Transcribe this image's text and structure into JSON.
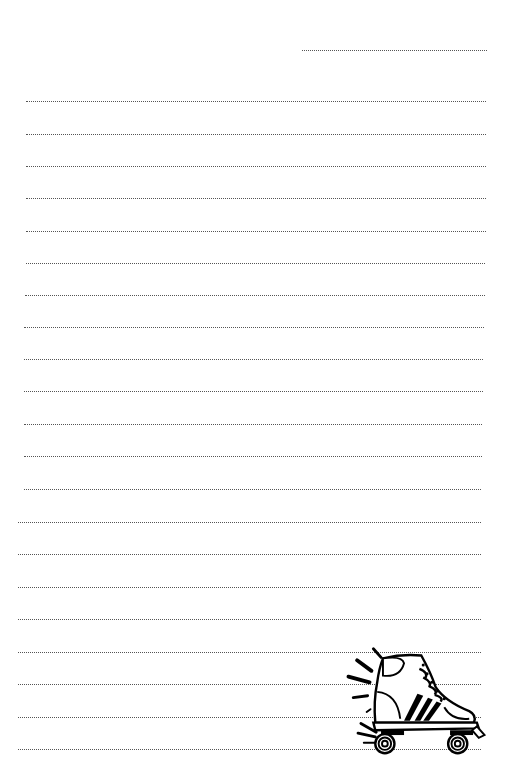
{
  "page": {
    "type": "lined notepaper",
    "background": "#ffffff",
    "line_color": "#555555",
    "line_style": "dotted"
  },
  "date_line": {
    "x1": 302,
    "x2": 487,
    "y": 50
  },
  "lines": [
    {
      "x1": 26,
      "x2": 486,
      "y": 101
    },
    {
      "x1": 26,
      "x2": 486,
      "y": 134
    },
    {
      "x1": 26,
      "x2": 486,
      "y": 166
    },
    {
      "x1": 26,
      "x2": 486,
      "y": 198
    },
    {
      "x1": 26,
      "x2": 486,
      "y": 231
    },
    {
      "x1": 26,
      "x2": 485,
      "y": 263
    },
    {
      "x1": 25,
      "x2": 485,
      "y": 295
    },
    {
      "x1": 24,
      "x2": 484,
      "y": 327
    },
    {
      "x1": 24,
      "x2": 483,
      "y": 359
    },
    {
      "x1": 24,
      "x2": 483,
      "y": 391
    },
    {
      "x1": 24,
      "x2": 482,
      "y": 424
    },
    {
      "x1": 24,
      "x2": 482,
      "y": 456
    },
    {
      "x1": 24,
      "x2": 481,
      "y": 489
    },
    {
      "x1": 18,
      "x2": 481,
      "y": 522
    },
    {
      "x1": 18,
      "x2": 481,
      "y": 554
    },
    {
      "x1": 18,
      "x2": 481,
      "y": 587
    },
    {
      "x1": 18,
      "x2": 481,
      "y": 619
    },
    {
      "x1": 18,
      "x2": 481,
      "y": 652
    },
    {
      "x1": 18,
      "x2": 481,
      "y": 684
    },
    {
      "x1": 18,
      "x2": 481,
      "y": 717
    },
    {
      "x1": 18,
      "x2": 481,
      "y": 749
    }
  ],
  "illustration": {
    "subject": "roller-skate-icon",
    "position": "bottom-right"
  }
}
